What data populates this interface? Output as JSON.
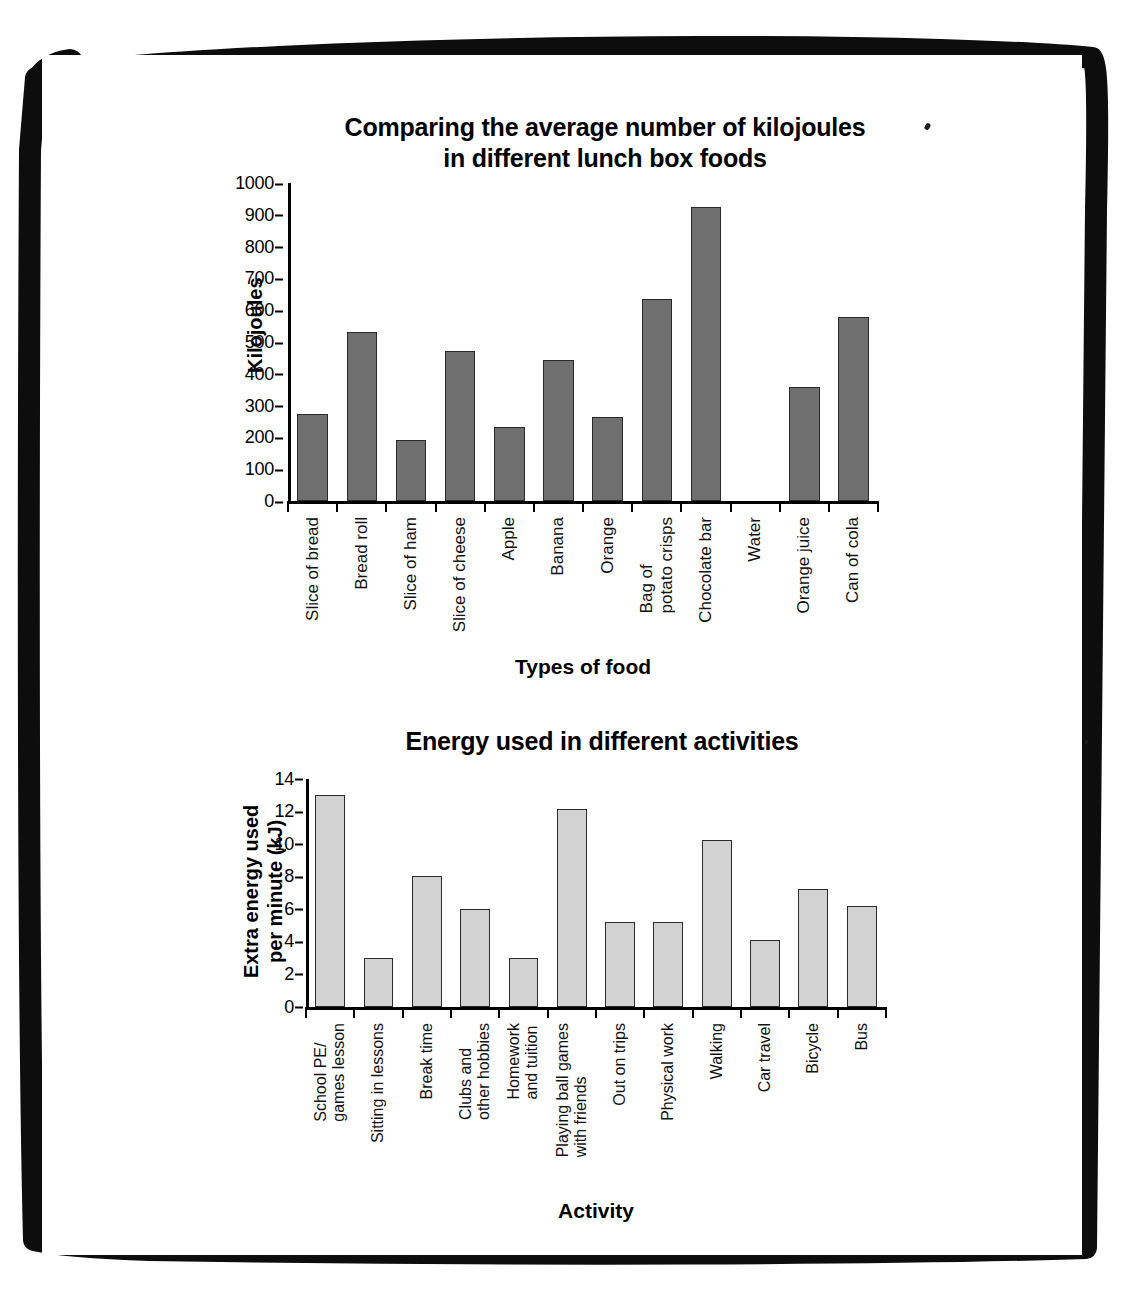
{
  "page": {
    "background_color": "#ffffff",
    "frame_color": "#000000"
  },
  "chart_data": [
    {
      "id": "food",
      "type": "bar",
      "title": "Comparing the average number of kilojoules\nin different lunch box foods",
      "title_lines": [
        "Comparing the average number of kilojoules",
        "in different lunch box foods"
      ],
      "xlabel": "Types of food",
      "ylabel": "Kilojoules",
      "ylim": [
        0,
        1000
      ],
      "yticks": [
        0,
        100,
        200,
        300,
        400,
        500,
        600,
        700,
        800,
        900,
        1000
      ],
      "ytick_labels": [
        "0",
        "100",
        "200",
        "300",
        "400",
        "500",
        "600",
        "700",
        "800",
        "900",
        "1000"
      ],
      "grid": false,
      "legend": false,
      "bar_color": "#6f6f6f",
      "bar_edge_color": "#2a2a2a",
      "categories": [
        "Slice of bread",
        "Bread roll",
        "Slice of ham",
        "Slice of cheese",
        "Apple",
        "Banana",
        "Orange",
        "Bag of\npotato crisps",
        "Chocolate bar",
        "Water",
        "Orange juice",
        "Can of cola"
      ],
      "values": [
        275,
        530,
        192,
        472,
        232,
        443,
        263,
        635,
        925,
        0,
        358,
        578
      ]
    },
    {
      "id": "activity",
      "type": "bar",
      "title": "Energy used in different activities",
      "title_lines": [
        "Energy used in different activities"
      ],
      "xlabel": "Activity",
      "ylabel": "Extra energy used\nper minute (kJ)",
      "ylim": [
        0,
        14
      ],
      "yticks": [
        0,
        2,
        4,
        6,
        8,
        10,
        12,
        14
      ],
      "ytick_labels": [
        "0",
        "2",
        "4",
        "6",
        "8",
        "10",
        "12",
        "14"
      ],
      "grid": false,
      "legend": false,
      "bar_color": "#d2d2d2",
      "bar_edge_color": "#2b2b2b",
      "categories": [
        "School PE/\ngames lesson",
        "Sitting in lessons",
        "Break time",
        "Clubs and\nother hobbies",
        "Homework\nand tuition",
        "Playing ball games\nwith friends",
        "Out on trips",
        "Physical work",
        "Walking",
        "Car travel",
        "Bicycle",
        "Bus"
      ],
      "values": [
        13,
        3,
        8,
        6,
        3,
        12.1,
        5.2,
        5.2,
        10.2,
        4.1,
        7.2,
        6.2
      ]
    }
  ]
}
